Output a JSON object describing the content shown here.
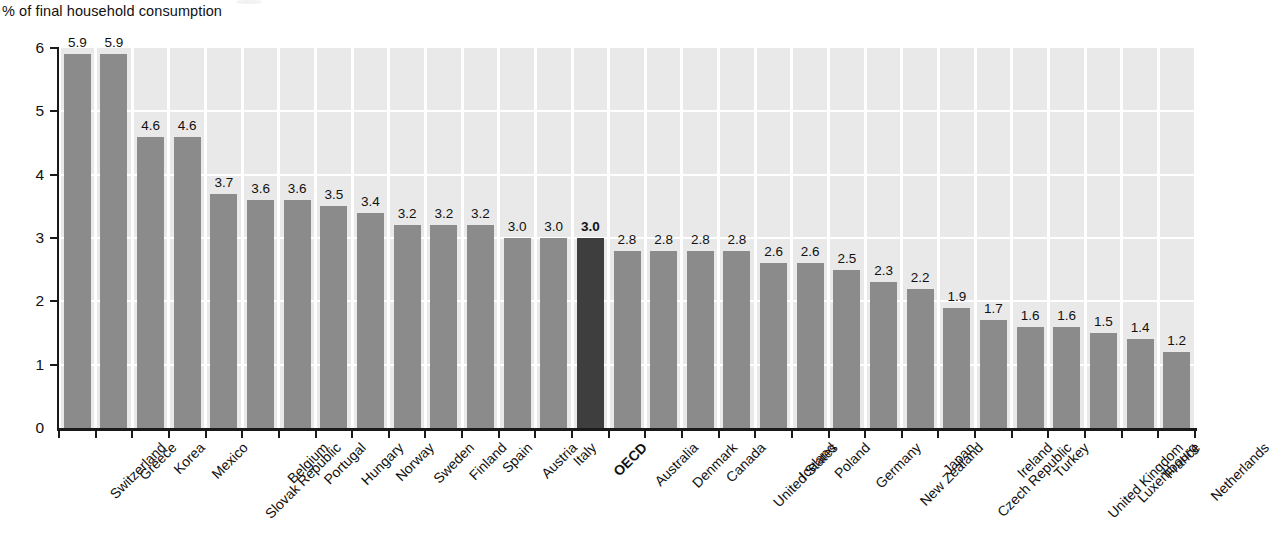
{
  "chart_data": {
    "type": "bar",
    "title": "",
    "ylabel": "% of final household consumption",
    "xlabel": "",
    "ylim": [
      0,
      6
    ],
    "yticks": [
      0,
      1,
      2,
      3,
      4,
      5,
      6
    ],
    "ytick_labels": [
      "0",
      "1",
      "2",
      "3",
      "4",
      "5",
      "6"
    ],
    "grid": true,
    "grid_axis": "both",
    "legend": false,
    "highlight_category": "OECD",
    "colors": {
      "bar": "#8b8b8b",
      "highlight_bar": "#3e3e3e",
      "plot_background": "#e9e9e9",
      "gridline": "#ffffff",
      "axis": "#1a1a1a",
      "text": "#111111"
    },
    "categories": [
      "Switzerland",
      "Greece",
      "Korea",
      "Mexico",
      "Slovak Republic",
      "Belgium",
      "Portugal",
      "Hungary",
      "Norway",
      "Sweden",
      "Finland",
      "Spain",
      "Austria",
      "Italy",
      "OECD",
      "Australia",
      "Denmark",
      "Canada",
      "United States",
      "Iceland",
      "Poland",
      "Germany",
      "New Zealand",
      "Japan",
      "Czech Republic",
      "Ireland",
      "Turkey",
      "United Kingdom",
      "Luxembourg",
      "France",
      "Netherlands"
    ],
    "values": [
      5.9,
      5.9,
      4.6,
      4.6,
      3.7,
      3.6,
      3.6,
      3.5,
      3.4,
      3.2,
      3.2,
      3.2,
      3.0,
      3.0,
      3.0,
      2.8,
      2.8,
      2.8,
      2.8,
      2.6,
      2.6,
      2.5,
      2.3,
      2.2,
      1.9,
      1.7,
      1.6,
      1.6,
      1.5,
      1.4,
      1.2
    ],
    "value_labels": [
      "5.9",
      "5.9",
      "4.6",
      "4.6",
      "3.7",
      "3.6",
      "3.6",
      "3.5",
      "3.4",
      "3.2",
      "3.2",
      "3.2",
      "3.0",
      "3.0",
      "3.0",
      "2.8",
      "2.8",
      "2.8",
      "2.8",
      "2.6",
      "2.6",
      "2.5",
      "2.3",
      "2.2",
      "1.9",
      "1.7",
      "1.6",
      "1.6",
      "1.5",
      "1.4",
      "1.2"
    ]
  }
}
